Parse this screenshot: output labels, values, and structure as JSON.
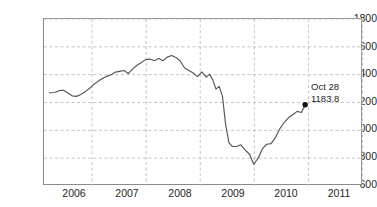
{
  "chart_data": {
    "type": "line",
    "title": "",
    "subtitle": "",
    "xlabel": "",
    "ylabel": "",
    "xlim": [
      2005.5,
      2011.4
    ],
    "ylim": [
      600,
      1800
    ],
    "yticks": [
      600,
      800,
      1000,
      1200,
      1400,
      1600,
      1800
    ],
    "ytick_labels": [
      "600",
      "800",
      "1000",
      "1200",
      "1400",
      "1600",
      "1800"
    ],
    "xticks": [
      2006,
      2007,
      2008,
      2009,
      2010,
      2011
    ],
    "xtick_labels": [
      "2006",
      "2007",
      "2008",
      "2009",
      "2010",
      "2011"
    ],
    "grid": true,
    "grid_style": "dashed",
    "grid_color": "#bdbdbd",
    "line_color": "#555555",
    "legend": null,
    "annotations": [
      {
        "name": "last-point",
        "date_label": "Oct 28",
        "value_label": "1183.8",
        "x": 2010.33,
        "y": 1183.8,
        "marker": "filled-circle",
        "marker_color": "#111111"
      }
    ],
    "series": [
      {
        "name": "index",
        "x": [
          2005.6,
          2005.7,
          2005.78,
          2005.86,
          2005.94,
          2006.02,
          2006.1,
          2006.18,
          2006.26,
          2006.34,
          2006.42,
          2006.5,
          2006.58,
          2006.66,
          2006.74,
          2006.82,
          2006.9,
          2006.98,
          2007.06,
          2007.14,
          2007.22,
          2007.3,
          2007.38,
          2007.46,
          2007.54,
          2007.62,
          2007.7,
          2007.78,
          2007.86,
          2007.94,
          2008.02,
          2008.1,
          2008.18,
          2008.26,
          2008.34,
          2008.42,
          2008.5,
          2008.56,
          2008.62,
          2008.68,
          2008.74,
          2008.8,
          2008.86,
          2008.92,
          2008.98,
          2009.06,
          2009.14,
          2009.22,
          2009.3,
          2009.38,
          2009.46,
          2009.54,
          2009.62,
          2009.7,
          2009.78,
          2009.86,
          2009.94,
          2010.02,
          2010.1,
          2010.18,
          2010.26,
          2010.33
        ],
        "y": [
          1270,
          1272,
          1285,
          1288,
          1268,
          1248,
          1244,
          1258,
          1278,
          1300,
          1330,
          1352,
          1372,
          1388,
          1400,
          1418,
          1424,
          1430,
          1408,
          1442,
          1468,
          1488,
          1508,
          1512,
          1500,
          1516,
          1500,
          1526,
          1538,
          1524,
          1498,
          1448,
          1430,
          1412,
          1386,
          1420,
          1382,
          1404,
          1364,
          1296,
          1316,
          1246,
          1040,
          912,
          884,
          884,
          896,
          860,
          828,
          756,
          800,
          868,
          900,
          904,
          948,
          1010,
          1056,
          1090,
          1112,
          1136,
          1128,
          1183.8
        ]
      }
    ]
  },
  "axes": {
    "y_labels": [
      "1800",
      "1600",
      "1400",
      "1200",
      "1000",
      "800",
      "600"
    ],
    "x_labels": [
      "2006",
      "2007",
      "2008",
      "2009",
      "2010",
      "2011"
    ]
  }
}
